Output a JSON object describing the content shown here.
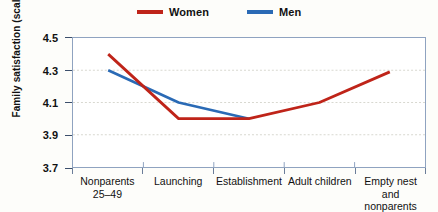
{
  "chart_data": {
    "type": "line",
    "title": "",
    "xlabel": "",
    "ylabel": "Family satisfaction (scale 1–5)",
    "categories": [
      "Nonparents 25–49",
      "Launching",
      "Establishment",
      "Adult children",
      "Empty nest and nonparents 50+"
    ],
    "category_lines": [
      [
        "Nonparents",
        "25–49"
      ],
      [
        "Launching"
      ],
      [
        "Establishment"
      ],
      [
        "Adult children"
      ],
      [
        "Empty nest and",
        "nonparents 50+"
      ]
    ],
    "ylim": [
      3.7,
      4.5
    ],
    "yticks": [
      3.7,
      3.9,
      4.1,
      4.3,
      4.5
    ],
    "ytick_labels": [
      "3.7",
      "3.9",
      "4.1",
      "4.3",
      "4.5"
    ],
    "grid": true,
    "legend_position": "top-center",
    "series": [
      {
        "name": "Women",
        "color": "#bf2419",
        "values": [
          4.4,
          4.0,
          4.0,
          4.1,
          4.29
        ]
      },
      {
        "name": "Men",
        "color": "#2a6ab5",
        "values": [
          4.3,
          4.1,
          4.0,
          null,
          null
        ]
      }
    ]
  },
  "legend": {
    "items": [
      {
        "label": "Women",
        "color": "#bf2419"
      },
      {
        "label": "Men",
        "color": "#2a6ab5"
      }
    ]
  },
  "axes": {
    "y_title": "Family satisfaction (scale 1–5)",
    "frame_color": "#8fa3c0",
    "gridline_color": "#d8d8cf"
  }
}
